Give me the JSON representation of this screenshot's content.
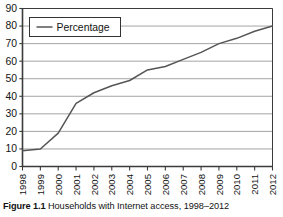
{
  "figure": {
    "caption_label": "Figure 1.1",
    "caption_text": "Households with Internet access, 1998–2012"
  },
  "legend": {
    "entries": [
      {
        "label": "Percentage",
        "color": "#555555",
        "marker": "line"
      }
    ],
    "position": "top-left-inside",
    "border_color": "#333333",
    "background": "#ffffff"
  },
  "axes": {
    "y_ticks": [
      "0",
      "10",
      "20",
      "30",
      "40",
      "50",
      "60",
      "70",
      "80",
      "90"
    ],
    "x_ticks": [
      "1998",
      "1999",
      "2000",
      "2001",
      "2002",
      "2003",
      "2004",
      "2005",
      "2006",
      "2007",
      "2008",
      "2009",
      "2010",
      "2011",
      "2012"
    ],
    "x_tick_rotation_deg": -90,
    "axis_color": "#3b3b3b",
    "gridline_color": "#9a9a9a"
  },
  "chart_data": {
    "type": "line",
    "title": "",
    "subtitle": "",
    "xlabel": "",
    "ylabel": "",
    "categories": [
      "1998",
      "1999",
      "2000",
      "2001",
      "2002",
      "2003",
      "2004",
      "2005",
      "2006",
      "2007",
      "2008",
      "2009",
      "2010",
      "2011",
      "2012"
    ],
    "series": [
      {
        "name": "Percentage",
        "color": "#555555",
        "values": [
          9,
          10,
          19,
          36,
          42,
          46,
          49,
          55,
          57,
          61,
          65,
          70,
          73,
          77,
          80
        ]
      }
    ],
    "ylim": [
      0,
      90
    ],
    "ytick_step": 10,
    "grid": "horizontal",
    "legend": "inside top-left",
    "units": "percent"
  }
}
